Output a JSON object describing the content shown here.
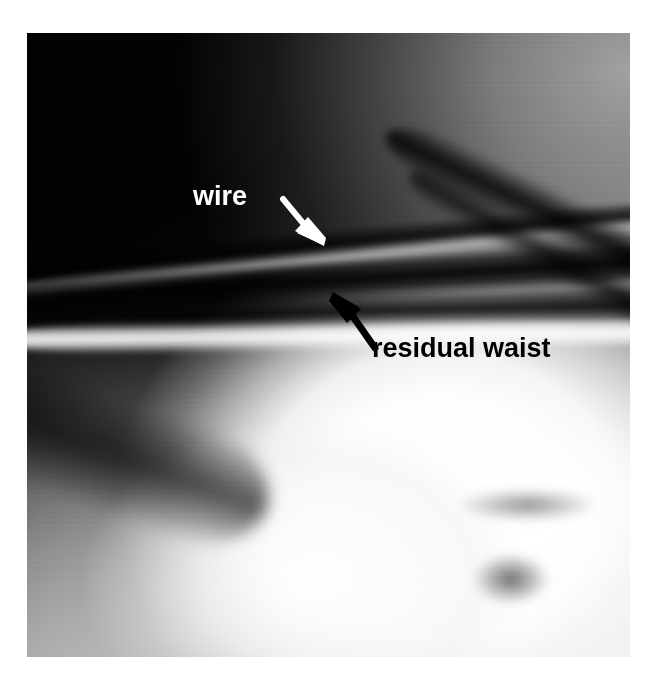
{
  "figure": {
    "type": "radiograph",
    "modality": "fluoroscopy",
    "colorspace": "grayscale",
    "background_color": "#ffffff",
    "plate": {
      "x": 27,
      "y": 33,
      "width": 603,
      "height": 624
    }
  },
  "annotations": [
    {
      "id": "wire",
      "label": "wire",
      "text_color": "#ffffff",
      "arrow_color": "#ffffff",
      "label_x": 166,
      "label_y": 148,
      "font_size_px": 27,
      "arrow_tail_x": 258,
      "arrow_tail_y": 168,
      "arrow_tip_x": 290,
      "arrow_tip_y": 208
    },
    {
      "id": "residual-waist",
      "label": "residual waist",
      "text_color": "#000000",
      "arrow_color": "#000000",
      "label_x": 345,
      "label_y": 300,
      "font_size_px": 27,
      "arrow_tail_x": 348,
      "arrow_tail_y": 312,
      "arrow_tip_x": 308,
      "arrow_tip_y": 261
    }
  ],
  "labels": {
    "wire": "wire",
    "residual_waist": "residual waist"
  },
  "colors": {
    "white_annotation": "#ffffff",
    "black_annotation": "#000000",
    "page_background": "#ffffff",
    "plate_darkest": "#050505",
    "plate_brightest": "#ffffff"
  }
}
